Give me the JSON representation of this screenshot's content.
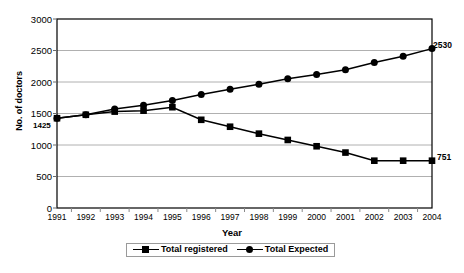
{
  "chart_data": {
    "type": "line",
    "title": "",
    "xlabel": "Year",
    "ylabel": "No. of doctors",
    "categories": [
      "1991",
      "1992",
      "1993",
      "1994",
      "1995",
      "1996",
      "1997",
      "1998",
      "1999",
      "2000",
      "2001",
      "2002",
      "2003",
      "2004"
    ],
    "x": [
      1991,
      1992,
      1993,
      1994,
      1995,
      1996,
      1997,
      1998,
      1999,
      2000,
      2001,
      2002,
      2003,
      2004
    ],
    "ylim": [
      0,
      3000
    ],
    "yticks": [
      "0",
      "500",
      "1000",
      "1500",
      "2000",
      "2500",
      "3000"
    ],
    "ytick_values": [
      0,
      500,
      1000,
      1500,
      2000,
      2500,
      3000
    ],
    "grid": "horizontal",
    "legend_position": "bottom",
    "series": [
      {
        "name": "Total registered",
        "marker": "square",
        "values": [
          1425,
          1480,
          1530,
          1545,
          1600,
          1400,
          1290,
          1180,
          1080,
          980,
          880,
          751,
          751,
          751
        ]
      },
      {
        "name": "Total Expected",
        "marker": "circle",
        "values": [
          1425,
          1480,
          1570,
          1630,
          1705,
          1800,
          1885,
          1965,
          2050,
          2120,
          2195,
          2310,
          2410,
          2530
        ]
      }
    ],
    "annotations": [
      {
        "name": "start-value-label",
        "text": "1425",
        "series": "Total registered",
        "x": 1991,
        "y": 1425
      },
      {
        "name": "expected-end-label",
        "text": "2530",
        "series": "Total Expected",
        "x": 2004,
        "y": 2530
      },
      {
        "name": "registered-end-label",
        "text": "751",
        "series": "Total registered",
        "x": 2004,
        "y": 751
      }
    ]
  },
  "legend": {
    "items": [
      {
        "label": "Total registered",
        "marker": "square"
      },
      {
        "label": "Total Expected",
        "marker": "circle"
      }
    ]
  },
  "axes": {
    "y_title": "No. of doctors",
    "x_title": "Year"
  }
}
